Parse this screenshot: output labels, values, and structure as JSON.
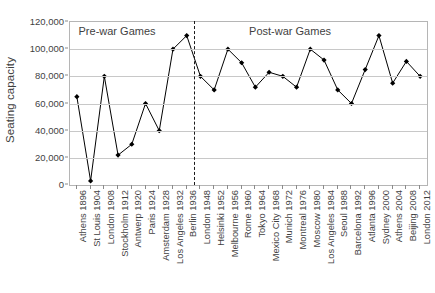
{
  "chart_data": {
    "type": "line",
    "title": "",
    "xlabel": "",
    "ylabel": "Seating capacity",
    "ylim": [
      0,
      120000
    ],
    "ytick_values": [
      0,
      20000,
      40000,
      60000,
      80000,
      100000,
      120000
    ],
    "ytick_labels": [
      "0",
      "20,000",
      "40,000",
      "60,000",
      "80,000",
      "100,000",
      "120,000"
    ],
    "grid": true,
    "legend": "none",
    "marker": "diamond",
    "line_color": "#000000",
    "marker_color": "#000000",
    "grid_color": "#c8c8c8",
    "axis_color": "#b5b5b5",
    "categories": [
      "Athens 1896",
      "St Louis 1904",
      "London 1908",
      "Stockholm 1912",
      "Antwerp 1920",
      "Paris 1924",
      "Amsterdam 1928",
      "Los Angeles 1932",
      "Berlin 1936",
      "London 1948",
      "Helsinki 1952",
      "Melbourne 1956",
      "Rome 1960",
      "Tokyo 1964",
      "Mexico City 1968",
      "Munich 1972",
      "Montreal 1976",
      "Moscow 1980",
      "Los Angeles 1984",
      "Seoul 1988",
      "Barcelona 1992",
      "Atlanta 1996",
      "Sydney 2000",
      "Athens 2004",
      "Beijing 2008",
      "London 2012"
    ],
    "values": [
      65000,
      3000,
      80000,
      22000,
      30000,
      60000,
      40000,
      100000,
      110000,
      80000,
      70000,
      100000,
      90000,
      72000,
      83000,
      80000,
      72000,
      100000,
      92000,
      70000,
      60000,
      85000,
      110000,
      75000,
      91000,
      80000
    ],
    "annotations": [
      {
        "name": "pre-war-label",
        "text": "Pre-war Games",
        "x_index": 3.0,
        "y_value": 113000
      },
      {
        "name": "post-war-label",
        "text": "Post-war Games",
        "x_index": 15.6,
        "y_value": 113000
      }
    ],
    "reference_lines": [
      {
        "name": "war-divider",
        "orientation": "vertical",
        "x_index": 8.55,
        "style": "dashed",
        "color": "#1a1a1a"
      }
    ]
  }
}
